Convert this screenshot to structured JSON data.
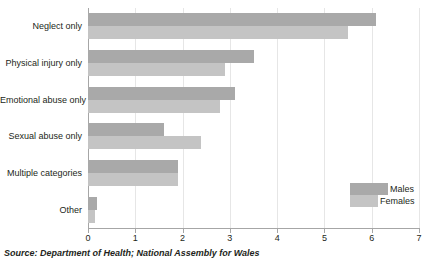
{
  "chart_data": {
    "type": "bar",
    "orientation": "horizontal",
    "title": "",
    "xlabel": "",
    "ylabel": "",
    "xlim": [
      0,
      7
    ],
    "xticks": [
      "0",
      "1",
      "2",
      "3",
      "4",
      "5",
      "6",
      "7"
    ],
    "grid": true,
    "legend_position": "bottom-right",
    "categories": [
      "Neglect only",
      "Physical injury only",
      "Emotional abuse only",
      "Sexual abuse only",
      "Multiple categories",
      "Other"
    ],
    "series": [
      {
        "name": "Males",
        "color": "#a9a9a9",
        "values": [
          6.1,
          3.5,
          3.1,
          1.6,
          1.9,
          0.2
        ]
      },
      {
        "name": "Females",
        "color": "#c4c4c4",
        "values": [
          5.5,
          2.9,
          2.8,
          2.4,
          1.9,
          0.15
        ]
      }
    ]
  },
  "legend": {
    "males_label": "Males",
    "females_label": "Females"
  },
  "source": {
    "text": "Source: Department of Health; National Assembly for Wales"
  },
  "colors": {
    "males": "#a9a9a9",
    "females": "#c4c4c4",
    "axis": "#a6a6a6",
    "grid": "#e6e6e6",
    "text": "#231f20",
    "background": "#ffffff"
  }
}
